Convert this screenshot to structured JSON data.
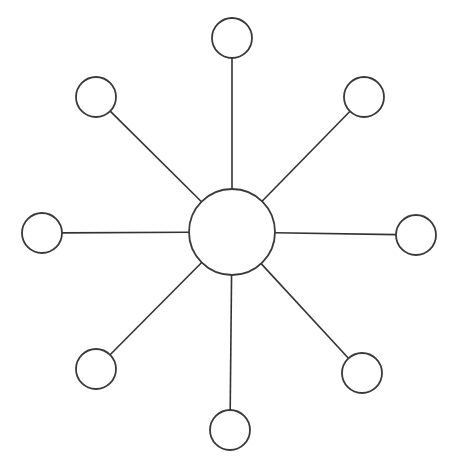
{
  "diagram": {
    "type": "star-network",
    "canvas": {
      "width": 456,
      "height": 473,
      "background": "#ffffff"
    },
    "stroke_color": "#333333",
    "hub": {
      "id": "hub",
      "cx": 232,
      "cy": 232,
      "r": 43
    },
    "satellites": [
      {
        "id": "top",
        "cx": 232,
        "cy": 38,
        "r": 20
      },
      {
        "id": "top-right",
        "cx": 364,
        "cy": 97,
        "r": 20
      },
      {
        "id": "right",
        "cx": 416,
        "cy": 235,
        "r": 20
      },
      {
        "id": "bottom-right",
        "cx": 362,
        "cy": 373,
        "r": 20
      },
      {
        "id": "bottom",
        "cx": 230,
        "cy": 430,
        "r": 20
      },
      {
        "id": "bottom-left",
        "cx": 96,
        "cy": 369,
        "r": 20
      },
      {
        "id": "left",
        "cx": 42,
        "cy": 233,
        "r": 20
      },
      {
        "id": "top-left",
        "cx": 96,
        "cy": 97,
        "r": 20
      }
    ]
  }
}
